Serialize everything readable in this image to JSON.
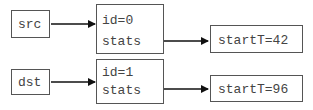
{
  "diagram": {
    "rows": [
      {
        "pointer": "src",
        "struct": {
          "field1": "id=0",
          "field2": "stats"
        },
        "target": "startT=42"
      },
      {
        "pointer": "dst",
        "struct": {
          "field1": "id=1",
          "field2": "stats"
        },
        "target": "startT=96"
      }
    ],
    "colors": {
      "stroke": "#555555",
      "arrow": "#111111",
      "text": "#444444"
    }
  }
}
